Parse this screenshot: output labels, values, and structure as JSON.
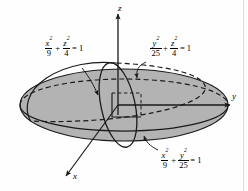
{
  "figure": {
    "background_color": "#fefefe",
    "surface_fill_color": "#b3b3b3",
    "stroke_color": "#1a1a1a"
  },
  "axes": [
    {
      "name": "z-axis",
      "label": "z",
      "direction": "up"
    },
    {
      "name": "y-axis",
      "label": "y",
      "direction": "right"
    },
    {
      "name": "x-axis",
      "label": "x",
      "direction": "down-left"
    }
  ],
  "equations": [
    {
      "id": "xz-trace",
      "name": "xz-trace-equation",
      "term1": {
        "num_var": "x",
        "num_exp": "2",
        "den": "9"
      },
      "term2": {
        "num_var": "z",
        "num_exp": "2",
        "den": "4"
      },
      "operator": "+",
      "rhs": "= 1",
      "plain": "x^2/9 + z^2/4 = 1"
    },
    {
      "id": "yz-trace",
      "name": "yz-trace-equation",
      "term1": {
        "num_var": "y",
        "num_exp": "2",
        "den": "25"
      },
      "term2": {
        "num_var": "z",
        "num_exp": "2",
        "den": "4"
      },
      "operator": "+",
      "rhs": "= 1",
      "plain": "y^2/25 + z^2/4 = 1"
    },
    {
      "id": "xy-trace",
      "name": "xy-trace-equation",
      "term1": {
        "num_var": "x",
        "num_exp": "2",
        "den": "9"
      },
      "term2": {
        "num_var": "y",
        "num_exp": "2",
        "den": "25"
      },
      "operator": "+",
      "rhs": "= 1",
      "plain": "x^2/9 + y^2/25 = 1"
    }
  ],
  "traces": [
    {
      "name": "equator-ellipse",
      "plane": "xy",
      "style": "solid-front-dashed-back"
    },
    {
      "name": "vertical-ellipse",
      "plane": "yz",
      "style": "solid"
    },
    {
      "name": "tilted-ellipse",
      "plane": "xz",
      "style": "solid-front-dashed-back"
    }
  ],
  "leaders": [
    {
      "name": "leader-xz",
      "from": "xz-trace-equation",
      "to": "tilted-ellipse"
    },
    {
      "name": "leader-yz",
      "from": "yz-trace-equation",
      "to": "vertical-ellipse"
    },
    {
      "name": "leader-xy",
      "from": "xy-trace-equation",
      "to": "equator-ellipse"
    }
  ]
}
